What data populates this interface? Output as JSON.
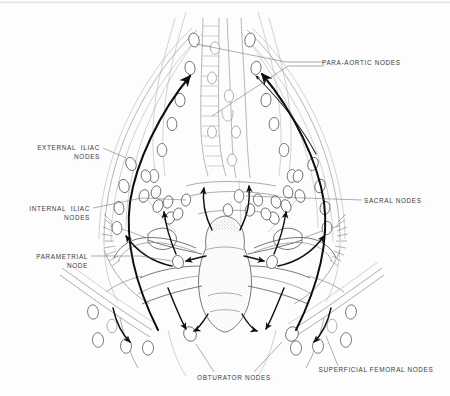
{
  "figure": {
    "style": "grayscale anatomical line drawing",
    "width": 450,
    "height": 396,
    "background_color": "#fdfdfd",
    "line_color": "#5e5e5e",
    "arrow_color": "#0d0d0d",
    "node_fill": "#ffffff"
  },
  "labels": [
    {
      "id": "para-aortic",
      "text": "PARA-AORTIC NODES",
      "align": "start",
      "x": 322,
      "y": 65,
      "lines": [
        "PARA-AORTIC NODES"
      ]
    },
    {
      "id": "external-iliac",
      "text": "EXTERNAL ILIAC NODES",
      "align": "end",
      "x": 100,
      "y": 150,
      "lines": [
        "EXTERNAL  ILIAC",
        "NODES"
      ]
    },
    {
      "id": "internal-iliac",
      "text": "INTERNAL ILIAC NODES",
      "align": "end",
      "x": 90,
      "y": 211,
      "lines": [
        "INTERNAL  ILIAC",
        "NODES"
      ]
    },
    {
      "id": "parametrial",
      "text": "PARAMETRIAL NODE",
      "align": "end",
      "x": 88,
      "y": 259,
      "lines": [
        "PARAMETRIAL",
        "NODE"
      ]
    },
    {
      "id": "sacral",
      "text": "SACRAL NODES",
      "align": "start",
      "x": 364,
      "y": 203,
      "lines": [
        "SACRAL  NODES"
      ]
    },
    {
      "id": "obturator",
      "text": "OBTURATOR NODES",
      "align": "middle",
      "x": 234,
      "y": 380,
      "lines": [
        "OBTURATOR  NODES"
      ]
    },
    {
      "id": "superficial-femoral",
      "text": "SUPERFICIAL FEMORAL NODES",
      "align": "middle",
      "x": 376,
      "y": 372,
      "lines": [
        "SUPERFICIAL  FEMORAL  NODES"
      ]
    }
  ],
  "node_groups": [
    {
      "name": "para-aortic-left-chain",
      "count": 6
    },
    {
      "name": "para-aortic-right-chain",
      "count": 6
    },
    {
      "name": "common-iliac-left",
      "count": 3
    },
    {
      "name": "common-iliac-right",
      "count": 3
    },
    {
      "name": "external-iliac-left",
      "count": 5
    },
    {
      "name": "external-iliac-right",
      "count": 5
    },
    {
      "name": "internal-iliac-left",
      "count": 4
    },
    {
      "name": "internal-iliac-right",
      "count": 4
    },
    {
      "name": "sacral",
      "count": 3
    },
    {
      "name": "parametrial-left",
      "count": 1
    },
    {
      "name": "parametrial-right",
      "count": 1
    },
    {
      "name": "obturator-left",
      "count": 1
    },
    {
      "name": "obturator-right",
      "count": 1
    },
    {
      "name": "superficial-femoral-left",
      "count": 5
    },
    {
      "name": "superficial-femoral-right",
      "count": 5
    }
  ],
  "anatomy": [
    {
      "name": "aorta",
      "kind": "vessel"
    },
    {
      "name": "inferior-vena-cava",
      "kind": "vessel"
    },
    {
      "name": "common-iliac-vessels",
      "kind": "vessel"
    },
    {
      "name": "external-iliac-vessels",
      "kind": "vessel"
    },
    {
      "name": "internal-iliac-vessels",
      "kind": "vessel"
    },
    {
      "name": "uterus",
      "kind": "organ"
    },
    {
      "name": "cervix",
      "kind": "organ"
    },
    {
      "name": "fallopian-tube-left",
      "kind": "organ"
    },
    {
      "name": "fallopian-tube-right",
      "kind": "organ"
    },
    {
      "name": "ovary-left",
      "kind": "organ"
    },
    {
      "name": "ovary-right",
      "kind": "organ"
    },
    {
      "name": "broad-ligament-left",
      "kind": "organ"
    },
    {
      "name": "broad-ligament-right",
      "kind": "organ"
    },
    {
      "name": "inguinal-ligament-left",
      "kind": "structure"
    },
    {
      "name": "inguinal-ligament-right",
      "kind": "structure"
    },
    {
      "name": "pelvic-brim",
      "kind": "structure"
    },
    {
      "name": "sacral-promontory",
      "kind": "structure"
    }
  ],
  "drainage_arrows": [
    {
      "from": "cervix",
      "to": "external-iliac-left"
    },
    {
      "from": "cervix",
      "to": "external-iliac-right"
    },
    {
      "from": "cervix",
      "to": "internal-iliac-left"
    },
    {
      "from": "cervix",
      "to": "internal-iliac-right"
    },
    {
      "from": "cervix",
      "to": "sacral"
    },
    {
      "from": "cervix",
      "to": "obturator-left"
    },
    {
      "from": "cervix",
      "to": "obturator-right"
    },
    {
      "from": "parametrial-left",
      "to": "internal-iliac-left"
    },
    {
      "from": "parametrial-right",
      "to": "internal-iliac-right"
    },
    {
      "from": "external-iliac-left",
      "to": "para-aortic-left-chain"
    },
    {
      "from": "external-iliac-right",
      "to": "para-aortic-right-chain"
    },
    {
      "from": "round-ligament-left",
      "to": "superficial-femoral-left"
    },
    {
      "from": "round-ligament-right",
      "to": "superficial-femoral-right"
    }
  ]
}
